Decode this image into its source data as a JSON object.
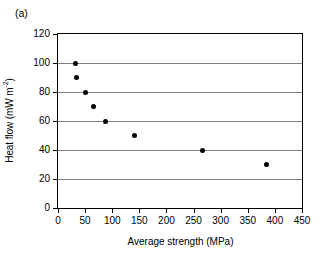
{
  "panel": {
    "label": "(a)"
  },
  "chart_data": {
    "type": "scatter",
    "title": "",
    "xlabel": "Average strength (MPa)",
    "ylabel": "Heat flow (mW m⁻²)",
    "ylabel_text": "Heat flow (mW m",
    "ylabel_sup": "-2",
    "ylabel_tail": ")",
    "xlim": [
      0,
      450
    ],
    "ylim": [
      0,
      120
    ],
    "xticks": [
      0,
      50,
      100,
      150,
      200,
      250,
      300,
      350,
      400,
      450
    ],
    "yticks": [
      0,
      20,
      40,
      60,
      80,
      100,
      120
    ],
    "xtick_labels": [
      "0",
      "50",
      "100",
      "150",
      "200",
      "250",
      "300",
      "350",
      "400",
      "450"
    ],
    "ytick_labels": [
      "0",
      "20",
      "40",
      "60",
      "80",
      "100",
      "120"
    ],
    "gridlines_y": [
      20,
      40,
      60,
      80,
      100
    ],
    "grid": "horizontal",
    "legend": "none",
    "marker": "filled-circle",
    "marker_color": "#000000",
    "grid_color": "#808080",
    "axis_color": "#000000",
    "x": [
      33,
      35,
      51,
      66,
      88,
      141,
      267,
      385
    ],
    "y": [
      100,
      90,
      80,
      70,
      60,
      50,
      40,
      30
    ],
    "points": [
      {
        "x": 33,
        "y": 100
      },
      {
        "x": 35,
        "y": 90
      },
      {
        "x": 51,
        "y": 80
      },
      {
        "x": 66,
        "y": 70
      },
      {
        "x": 88,
        "y": 60
      },
      {
        "x": 141,
        "y": 50
      },
      {
        "x": 267,
        "y": 40
      },
      {
        "x": 385,
        "y": 30
      }
    ]
  }
}
